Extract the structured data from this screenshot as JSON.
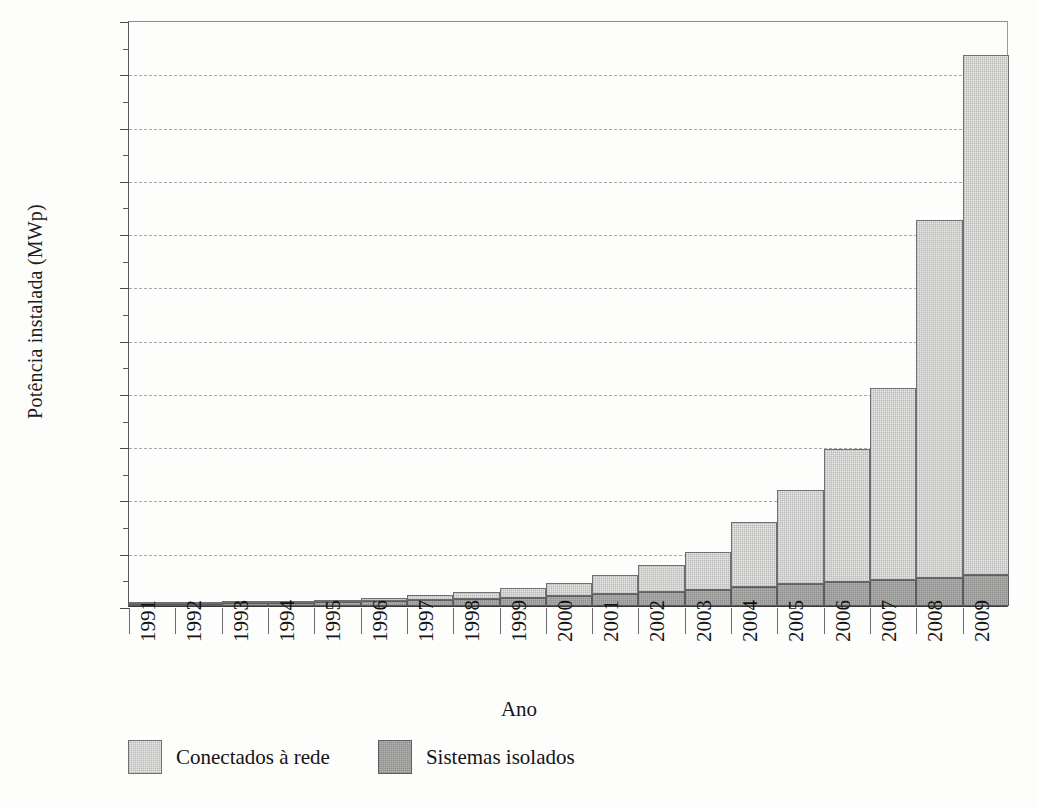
{
  "chart_data": {
    "type": "bar",
    "subtype": "stacked-bar",
    "title": "",
    "xlabel": "Ano",
    "ylabel": "Potência instalada (MWp)",
    "categories": [
      "1991",
      "1992",
      "1993",
      "1994",
      "1995",
      "1996",
      "1997",
      "1998",
      "1999",
      "2000",
      "2001",
      "2002",
      "2003",
      "2004",
      "2005",
      "2006",
      "2007",
      "2008",
      "2009"
    ],
    "series": [
      {
        "name": "Sistemas isolados",
        "color": "#b3b3b1",
        "values": [
          60,
          75,
          95,
          115,
          140,
          170,
          210,
          260,
          310,
          380,
          450,
          530,
          620,
          720,
          820,
          900,
          960,
          1060,
          1180
        ]
      },
      {
        "name": "Conectados à rede",
        "color": "#e8e8e6",
        "values": [
          20,
          30,
          45,
          65,
          90,
          150,
          200,
          260,
          350,
          500,
          700,
          1000,
          1400,
          2430,
          3530,
          5000,
          7240,
          13440,
          19520
        ]
      }
    ],
    "totals": [
      80,
      105,
      140,
      180,
      230,
      320,
      410,
      520,
      660,
      880,
      1150,
      1530,
      2020,
      3150,
      4350,
      5900,
      8200,
      14500,
      20700
    ],
    "ylim": [
      0,
      22000
    ],
    "ytick_step": 2000,
    "yminor_step": 1000,
    "ytick_labels": [
      "0",
      "2.000",
      "4.000",
      "6.000",
      "8.000",
      "10.000",
      "12.000",
      "14.000",
      "16.000",
      "18.000",
      "20.000",
      "22.000"
    ],
    "ytick_values": [
      0,
      2000,
      4000,
      6000,
      8000,
      10000,
      12000,
      14000,
      16000,
      18000,
      20000,
      22000
    ],
    "grid": "horizontal-dashed",
    "legend_position": "bottom-left",
    "legend": [
      {
        "label": "Conectados à rede",
        "color": "#e8e8e6"
      },
      {
        "label": "Sistemas isolados",
        "color": "#b3b3b1"
      }
    ]
  },
  "axes": {
    "y_title": "Potência instalada (MWp)",
    "x_title": "Ano"
  }
}
